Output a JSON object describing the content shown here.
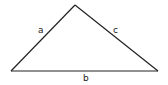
{
  "diagram": {
    "type": "triangle",
    "vertices": {
      "left": [
        11,
        71
      ],
      "apex": [
        75,
        5
      ],
      "right": [
        158,
        71
      ]
    },
    "stroke_color": "#222222",
    "sides": [
      {
        "id": "a",
        "label": "a",
        "from": "left",
        "to": "apex"
      },
      {
        "id": "b",
        "label": "b",
        "from": "left",
        "to": "right"
      },
      {
        "id": "c",
        "label": "c",
        "from": "apex",
        "to": "right"
      }
    ]
  },
  "labels": {
    "a": "a",
    "b": "b",
    "c": "c"
  }
}
